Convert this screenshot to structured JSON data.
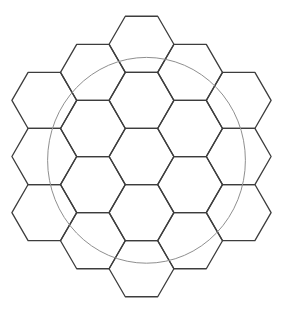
{
  "figure": {
    "canvas": {
      "width": 282,
      "height": 313
    },
    "background_color": "#ffffff",
    "hex_grid": {
      "orientation": "flat-top",
      "hexagon_count": 19,
      "side": 32.4,
      "stroke_color": "#3d3d3d",
      "stroke_width": 1.3,
      "fill": "none",
      "columns": [
        {
          "x": 44.3,
          "ys": [
            100.4,
            156.5,
            212.6
          ]
        },
        {
          "x": 92.9,
          "ys": [
            72.4,
            128.5,
            184.6,
            240.7
          ]
        },
        {
          "x": 141.5,
          "ys": [
            44.3,
            100.4,
            156.5,
            212.6,
            268.7
          ]
        },
        {
          "x": 190.1,
          "ys": [
            72.4,
            128.5,
            184.6,
            240.7
          ]
        },
        {
          "x": 238.7,
          "ys": [
            100.4,
            156.5,
            212.6
          ]
        }
      ]
    },
    "overlay_circle": {
      "cx": 146.5,
      "cy": 160.3,
      "rx": 98.9,
      "ry": 102.9,
      "stroke_color": "#8f8f8f",
      "stroke_width": 1,
      "fill": "none"
    }
  }
}
